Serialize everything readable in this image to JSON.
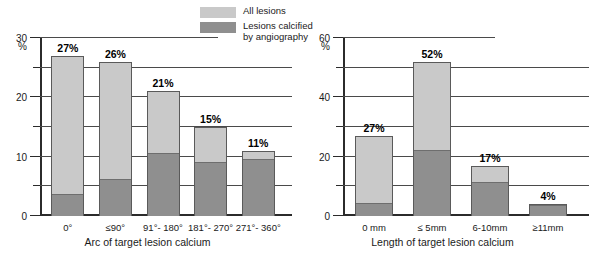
{
  "legend": {
    "items": [
      {
        "label": "All lesions",
        "color": "#c9c9c9",
        "swatch_name": "legend-swatch-all-lesions"
      },
      {
        "label": "Lesions calcified\nby angiography",
        "color": "#8f8f8f",
        "swatch_name": "legend-swatch-calcified"
      }
    ]
  },
  "chart_data": [
    {
      "type": "bar",
      "id": "arc-of-target-lesion-calcium",
      "title": "",
      "xlabel": "Arc of target lesion calcium",
      "ylabel": "%",
      "ylim": [
        0,
        30
      ],
      "yticks": [
        0,
        10,
        20,
        30
      ],
      "yticks_minor": [
        5,
        15,
        25
      ],
      "ytick_labels": [
        "0",
        "10",
        "20",
        "30"
      ],
      "grid": true,
      "stacked": true,
      "legend_position": "top-center",
      "categories": [
        "0°",
        "≤90°",
        "91°- 180°",
        "181°- 270°",
        "271°- 360°"
      ],
      "series": [
        {
          "name": "All lesions",
          "values": [
            27,
            26,
            21,
            15,
            11
          ]
        },
        {
          "name": "Lesions calcified by angiography",
          "values": [
            3.5,
            6,
            10.5,
            9,
            9.5
          ]
        }
      ],
      "data_labels": [
        "27%",
        "26%",
        "21%",
        "15%",
        "11%"
      ]
    },
    {
      "type": "bar",
      "id": "length-of-target-lesion-calcium",
      "title": "",
      "xlabel": "Length of target lesion calcium",
      "ylabel": "%",
      "ylim": [
        0,
        60
      ],
      "yticks": [
        0,
        20,
        40,
        60
      ],
      "yticks_minor": [
        10,
        30,
        50
      ],
      "ytick_labels": [
        "0",
        "20",
        "40",
        "60"
      ],
      "grid": true,
      "stacked": true,
      "legend_position": "top-center",
      "categories": [
        "0 mm",
        "≤ 5mm",
        "6-10mm",
        "≥11mm"
      ],
      "series": [
        {
          "name": "All lesions",
          "values": [
            27,
            52,
            17,
            4
          ]
        },
        {
          "name": "Lesions calcified by angiography",
          "values": [
            4,
            22,
            11,
            3.5
          ]
        }
      ],
      "data_labels": [
        "27%",
        "52%",
        "17%",
        "4%"
      ]
    }
  ]
}
